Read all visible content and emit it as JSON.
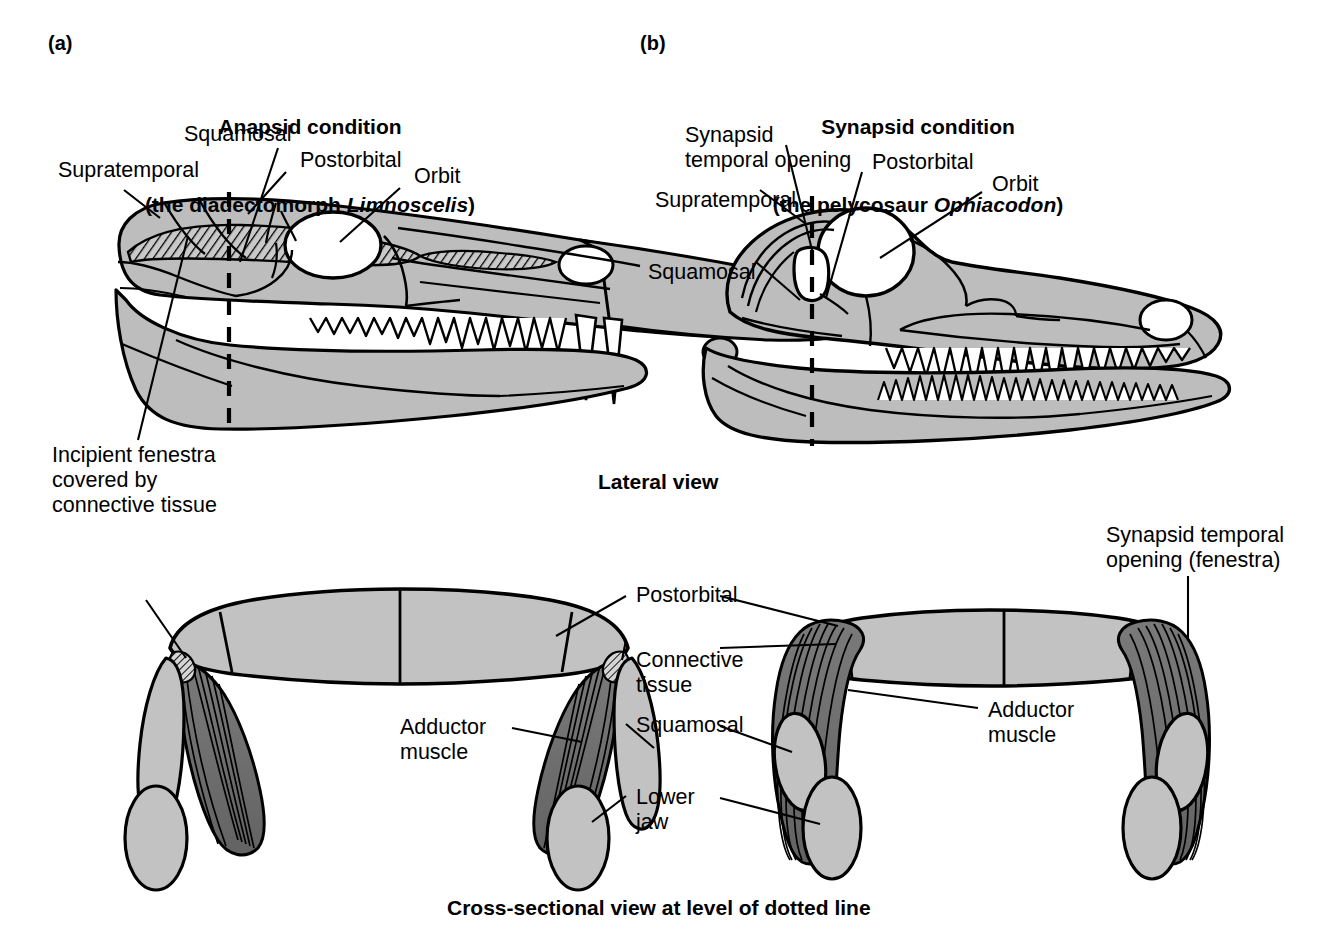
{
  "figure": {
    "panels": [
      {
        "tag": "(a)",
        "title_line1": "Anapsid condition",
        "title_line2_prefix": "(the diadectomorph ",
        "title_line2_italic": "Limnoscelis",
        "title_line2_suffix": ")",
        "labels": [
          "Supratemporal",
          "Squamosal",
          "Postorbital",
          "Orbit",
          "Incipient fenestra",
          "covered by",
          "connective tissue"
        ]
      },
      {
        "tag": "(b)",
        "title_line1": "Synapsid condition",
        "title_line2_prefix": "(the pelycosaur ",
        "title_line2_italic": "Ophiacodon",
        "title_line2_suffix": ")",
        "labels": [
          "Synapsid",
          "temporal opening",
          "Supratemporal",
          "Squamosal",
          "Postorbital",
          "Orbit"
        ]
      }
    ],
    "lateral_caption": "Lateral view",
    "cross_caption": "Cross-sectional view at level of dotted line",
    "cross_labels": {
      "postorbital": "Postorbital",
      "connective_line1": "Connective",
      "connective_line2": "tissue",
      "adductor_line1": "Adductor",
      "adductor_line2": "muscle",
      "squamosal": "Squamosal",
      "lower_line1": "Lower",
      "lower_line2": "jaw",
      "synapsid_line1": "Synapsid temporal",
      "synapsid_line2": "opening (fenestra)",
      "adductor_right_line1": "Adductor",
      "adductor_right_line2": "muscle"
    },
    "colors": {
      "bone_fill": "#bdbdbd",
      "bone_fill_light": "#c9c9c9",
      "muscle_fill": "#6e6e6e",
      "outline": "#000000",
      "background": "#ffffff",
      "opening_fill": "#ffffff"
    }
  }
}
